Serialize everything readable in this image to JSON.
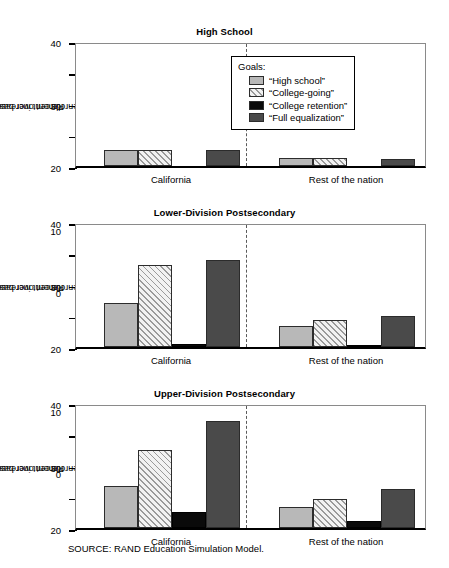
{
  "source_note": "SOURCE:  RAND Education Simulation Model.",
  "axis": {
    "ylabel_line1": "Percent increase in",
    "ylabel_line2": "enrollment over base case",
    "ticks": [
      "0",
      "10",
      "20",
      "30",
      "40"
    ],
    "ymin": 0,
    "ymax": 40
  },
  "legend": {
    "title": "Goals:",
    "items": [
      {
        "label": "“High school”",
        "key": "high_school",
        "swatch": "light-gray-swatch"
      },
      {
        "label": "“College-going”",
        "key": "college_going",
        "swatch": "hatched-swatch"
      },
      {
        "label": "“College retention”",
        "key": "college_retention",
        "swatch": "black-swatch"
      },
      {
        "label": "“Full equalization”",
        "key": "full_equalization",
        "swatch": "dark-gray-swatch"
      }
    ]
  },
  "groups": [
    "California",
    "Rest of the nation"
  ],
  "chart_data": [
    {
      "type": "bar",
      "title": "High School",
      "xlabel": "",
      "ylabel": "Percent increase in enrollment over base case",
      "ylim": [
        0,
        40
      ],
      "yticks": [
        0,
        10,
        20,
        30,
        40
      ],
      "grid": false,
      "legend_position": "inside-top-center",
      "categories": [
        "California",
        "Rest of the nation"
      ],
      "series": [
        {
          "name": "“High school”",
          "values": [
            5.2,
            2.6
          ]
        },
        {
          "name": "“College-going”",
          "values": [
            5.2,
            2.6
          ]
        },
        {
          "name": "“College retention”",
          "values": [
            0.0,
            0.0
          ]
        },
        {
          "name": "“Full equalization”",
          "values": [
            5.0,
            2.1
          ]
        }
      ]
    },
    {
      "type": "bar",
      "title": "Lower-Division Postsecondary",
      "xlabel": "",
      "ylabel": "Percent increase in enrollment over base case",
      "ylim": [
        0,
        40
      ],
      "yticks": [
        0,
        10,
        20,
        30,
        40
      ],
      "grid": false,
      "categories": [
        "California",
        "Rest of the nation"
      ],
      "series": [
        {
          "name": "“High school”",
          "values": [
            14.1,
            6.8
          ]
        },
        {
          "name": "“College-going”",
          "values": [
            26.3,
            8.8
          ]
        },
        {
          "name": "“College retention”",
          "values": [
            1.0,
            0.3
          ]
        },
        {
          "name": "“Full equalization”",
          "values": [
            27.9,
            9.8
          ]
        }
      ]
    },
    {
      "type": "bar",
      "title": "Upper-Division Postsecondary",
      "xlabel": "",
      "ylabel": "Percent increase in enrollment over base case",
      "ylim": [
        0,
        40
      ],
      "yticks": [
        0,
        10,
        20,
        30,
        40
      ],
      "grid": false,
      "categories": [
        "California",
        "Rest of the nation"
      ],
      "series": [
        {
          "name": "“High school”",
          "values": [
            13.6,
            6.7
          ]
        },
        {
          "name": "“College-going”",
          "values": [
            25.0,
            9.2
          ]
        },
        {
          "name": "“College retention”",
          "values": [
            5.2,
            2.3
          ]
        },
        {
          "name": "“Full equalization”",
          "values": [
            34.2,
            12.5
          ]
        }
      ]
    }
  ]
}
